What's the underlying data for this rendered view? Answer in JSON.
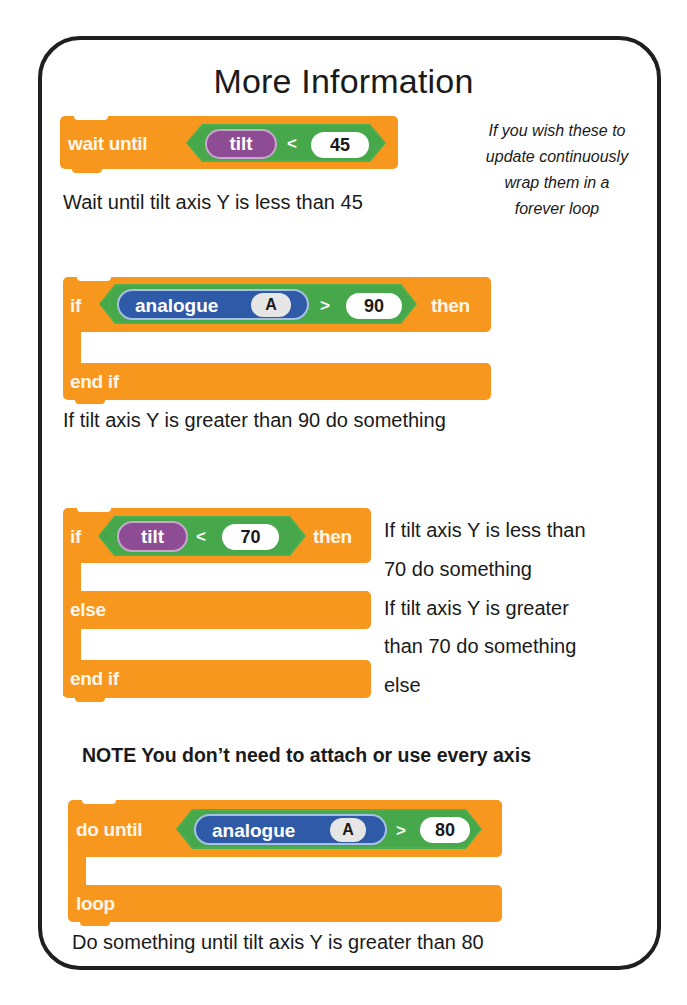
{
  "title": "More Information",
  "side_note": {
    "lines": [
      "If you wish these to",
      "update continuously",
      "wrap them in a",
      "forever loop"
    ]
  },
  "blocks": {
    "wait_until": {
      "keyword": "wait until",
      "sensor": "tilt",
      "operator": "<",
      "value": "45",
      "description": "Wait until tilt axis Y is less than 45"
    },
    "if_analogue": {
      "keyword_if": "if",
      "sensor": "analogue",
      "pin": "A",
      "operator": ">",
      "value": "90",
      "keyword_then": "then",
      "keyword_end": "end if",
      "description": "If tilt axis Y is greater than 90 do something"
    },
    "if_else_tilt": {
      "keyword_if": "if",
      "sensor": "tilt",
      "operator": "<",
      "value": "70",
      "keyword_then": "then",
      "keyword_else": "else",
      "keyword_end": "end if",
      "description_lines": [
        "If tilt axis Y is less than",
        "70 do something",
        "If tilt axis Y is greater",
        "than 70 do something",
        "else"
      ]
    },
    "do_until": {
      "keyword": "do until",
      "sensor": "analogue",
      "pin": "A",
      "operator": ">",
      "value": "80",
      "keyword_end": "loop",
      "description": "Do something until tilt axis Y is greater than 80"
    }
  },
  "note": "NOTE You don’t need to attach or use every axis",
  "colors": {
    "control_block": "#f7971e",
    "operator_hex": "#4caf50",
    "tilt_reporter": "#8e4c95",
    "analogue_reporter": "#2f5aa8",
    "card_border": "#1f1f1f"
  }
}
